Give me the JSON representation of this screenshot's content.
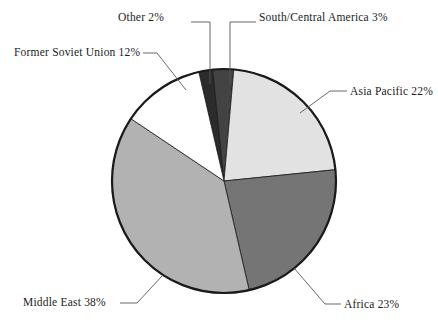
{
  "chart_data": {
    "type": "pie",
    "title": "",
    "subtitle": "",
    "xlabel": "",
    "ylabel": "",
    "legend_position": "none",
    "grid": false,
    "units": "percent",
    "total": 100,
    "start_angle_deg": -13,
    "direction": "clockwise",
    "categories": [
      "Other",
      "South/Central America",
      "Asia Pacific",
      "Africa",
      "Middle East",
      "Former Soviet Union"
    ],
    "values": [
      2,
      3,
      22,
      23,
      38,
      12
    ],
    "slices": [
      {
        "label": "Other",
        "value": 2,
        "value_text": "2%",
        "label_text": "Other 2%",
        "color": "#2b2b2b",
        "start_deg": -13,
        "end_deg": -5.8
      },
      {
        "label": "South/Central America",
        "value": 3,
        "value_text": "3%",
        "label_text": "South/Central America 3%",
        "color": "#434343",
        "start_deg": -5.8,
        "end_deg": 5.0
      },
      {
        "label": "Asia Pacific",
        "value": 22,
        "value_text": "22%",
        "label_text": "Asia Pacific 22%",
        "color": "#e2e2e2",
        "start_deg": 5.0,
        "end_deg": 84.2
      },
      {
        "label": "Africa",
        "value": 23,
        "value_text": "23%",
        "label_text": "Africa 23%",
        "color": "#757575",
        "start_deg": 84.2,
        "end_deg": 167.0
      },
      {
        "label": "Middle East",
        "value": 38,
        "value_text": "38%",
        "label_text": "Middle East 38%",
        "color": "#b2b2b2",
        "start_deg": 167.0,
        "end_deg": 303.8
      },
      {
        "label": "Former Soviet Union",
        "value": 12,
        "value_text": "12%",
        "label_text": "Former Soviet Union 12%",
        "color": "#ffffff",
        "start_deg": 303.8,
        "end_deg": 347.0
      }
    ],
    "colors": {
      "other": "#2b2b2b",
      "south_central_america": "#434343",
      "asia_pacific": "#e2e2e2",
      "africa": "#757575",
      "middle_east": "#b2b2b2",
      "former_soviet_union": "#ffffff",
      "outline": "#1a1a1a",
      "leader_line": "#585858",
      "background": "#ffffff",
      "text": "#1c1c1c"
    }
  },
  "labels": {
    "other": "Other 2%",
    "south_central_america": "South/Central America 3%",
    "former_soviet_union": "Former Soviet Union 12%",
    "asia_pacific": "Asia Pacific 22%",
    "middle_east": "Middle East 38%",
    "africa": "Africa 23%"
  }
}
